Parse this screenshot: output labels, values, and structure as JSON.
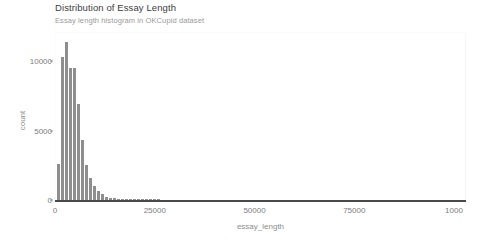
{
  "chart_data": {
    "type": "bar",
    "title": "Distribution of Essay Length",
    "subtitle": "Essay length histogram in OKCupid dataset",
    "xlabel": "essay_length",
    "ylabel": "count",
    "xlim": [
      0,
      103000
    ],
    "ylim": [
      0,
      12100
    ],
    "grid": false,
    "legend": null,
    "bar_color": "#8e8e8e",
    "bin_width": 1000,
    "x_ticks": [
      {
        "value": 0,
        "label": "0"
      },
      {
        "value": 25000,
        "label": "25000"
      },
      {
        "value": 50000,
        "label": "50000"
      },
      {
        "value": 75000,
        "label": "75000"
      },
      {
        "value": 100000,
        "label": "1000"
      }
    ],
    "y_ticks": [
      {
        "value": 0,
        "label": "0"
      },
      {
        "value": 5000,
        "label": "5000"
      },
      {
        "value": 10000,
        "label": "10000"
      }
    ],
    "bins": [
      {
        "x": 0,
        "value": 2600
      },
      {
        "x": 1000,
        "value": 10300
      },
      {
        "x": 2000,
        "value": 11400
      },
      {
        "x": 3000,
        "value": 9500
      },
      {
        "x": 4000,
        "value": 9500
      },
      {
        "x": 5000,
        "value": 6900
      },
      {
        "x": 6000,
        "value": 4300
      },
      {
        "x": 7000,
        "value": 2500
      },
      {
        "x": 8000,
        "value": 1600
      },
      {
        "x": 9000,
        "value": 1000
      },
      {
        "x": 10000,
        "value": 650
      },
      {
        "x": 11000,
        "value": 400
      },
      {
        "x": 12000,
        "value": 250
      },
      {
        "x": 13000,
        "value": 160
      },
      {
        "x": 14000,
        "value": 110
      },
      {
        "x": 15000,
        "value": 70
      },
      {
        "x": 16000,
        "value": 45
      },
      {
        "x": 17000,
        "value": 30
      },
      {
        "x": 18000,
        "value": 20
      },
      {
        "x": 19000,
        "value": 14
      },
      {
        "x": 20000,
        "value": 10
      },
      {
        "x": 21000,
        "value": 7
      },
      {
        "x": 22000,
        "value": 5
      },
      {
        "x": 23000,
        "value": 4
      },
      {
        "x": 24000,
        "value": 3
      },
      {
        "x": 25000,
        "value": 2
      }
    ]
  }
}
